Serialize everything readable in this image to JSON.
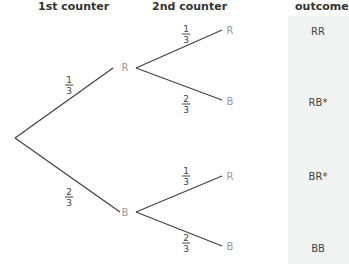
{
  "headers": {
    "first": "1st counter",
    "second": "2nd counter",
    "outcome": "outcome"
  },
  "level1": [
    {
      "label": "R",
      "prob_num": "1",
      "prob_den": "3"
    },
    {
      "label": "B",
      "prob_num": "2",
      "prob_den": "3"
    }
  ],
  "level2": [
    {
      "label": "R",
      "prob_num": "1",
      "prob_den": "3"
    },
    {
      "label": "B",
      "prob_num": "2",
      "prob_den": "3"
    },
    {
      "label": "R",
      "prob_num": "1",
      "prob_den": "3"
    },
    {
      "label": "B",
      "prob_num": "2",
      "prob_den": "3"
    }
  ],
  "outcomes": [
    "RR",
    "RB*",
    "BR*",
    "BB"
  ],
  "colors": {
    "line": "#444444",
    "node": "#9a9a9a",
    "panel": "#f1f2f2"
  }
}
